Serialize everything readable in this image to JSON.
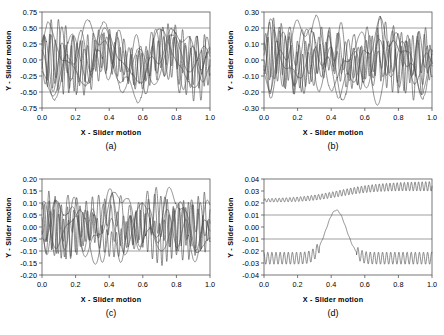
{
  "figure": {
    "type": "multi-panel-line-plot",
    "panels": 4,
    "shared_xlabel": "X - Slider motion",
    "shared_ylabel": "Y - Slider motion"
  },
  "chart_data": [
    {
      "type": "line",
      "panel": "a",
      "caption": "(a)",
      "title": "",
      "xlabel": "X - Slider motion",
      "ylabel": "Y - Slider motion",
      "xlim": [
        0.0,
        1.0
      ],
      "ylim": [
        -0.75,
        0.75
      ],
      "xticks": [
        0.0,
        0.2,
        0.4,
        0.6,
        0.8,
        1.0
      ],
      "xticklabels": [
        "0.0",
        "0.2",
        "0.4",
        "0.6",
        "0.8",
        "1.0"
      ],
      "yticks": [
        -0.75,
        -0.5,
        -0.25,
        0.0,
        0.25,
        0.5,
        0.75
      ],
      "yticklabels": [
        "-0.75",
        "-0.50",
        "-0.25",
        "0.00",
        "0.25",
        "0.50",
        "0.75"
      ],
      "grid": false,
      "legend": "none",
      "reference_lines": [
        0.5,
        -0.5
      ],
      "n_series": 7,
      "series": [
        {
          "name": "trace-1",
          "amp": 0.52,
          "freq": 23.0,
          "phase": 0.0,
          "drift": 0.0,
          "env": 1.0,
          "mod": 2.0
        },
        {
          "name": "trace-2",
          "amp": 0.5,
          "freq": 9.0,
          "phase": 1.1,
          "drift": 0.05,
          "env": 0.9,
          "mod": 3.0
        },
        {
          "name": "trace-3",
          "amp": 0.48,
          "freq": 5.0,
          "phase": 2.3,
          "drift": -0.04,
          "env": 1.0,
          "mod": 1.0
        },
        {
          "name": "trace-4",
          "amp": 0.51,
          "freq": 3.0,
          "phase": 0.6,
          "drift": 0.0,
          "env": 1.0,
          "mod": 5.0
        },
        {
          "name": "trace-5",
          "amp": 0.46,
          "freq": 15.0,
          "phase": 3.0,
          "drift": 0.02,
          "env": 0.85,
          "mod": 2.5
        },
        {
          "name": "trace-6",
          "amp": 0.53,
          "freq": 2.0,
          "phase": 4.2,
          "drift": -0.02,
          "env": 1.0,
          "mod": 7.0
        },
        {
          "name": "trace-7",
          "amp": 0.49,
          "freq": 31.0,
          "phase": 5.1,
          "drift": 0.0,
          "env": 0.8,
          "mod": 1.5
        }
      ]
    },
    {
      "type": "line",
      "panel": "b",
      "caption": "(b)",
      "title": "",
      "xlabel": "X - Slider motion",
      "ylabel": "Y - Slider motion",
      "xlim": [
        0.0,
        1.0
      ],
      "ylim": [
        -0.3,
        0.3
      ],
      "xticks": [
        0.0,
        0.2,
        0.4,
        0.6,
        0.8,
        1.0
      ],
      "xticklabels": [
        "0.0",
        "0.2",
        "0.4",
        "0.6",
        "0.8",
        "1.0"
      ],
      "yticks": [
        -0.3,
        -0.2,
        -0.1,
        0.0,
        0.1,
        0.2,
        0.3
      ],
      "yticklabels": [
        "-0.30",
        "-0.20",
        "-0.10",
        "0.00",
        "0.10",
        "0.20",
        "0.30"
      ],
      "grid": false,
      "legend": "none",
      "reference_lines": [
        0.2,
        -0.2
      ],
      "n_series": 7,
      "series": [
        {
          "name": "trace-1",
          "amp": 0.21,
          "freq": 21.0,
          "phase": 0.4,
          "drift": 0.03,
          "env": 0.95,
          "mod": 2.0
        },
        {
          "name": "trace-2",
          "amp": 0.2,
          "freq": 13.0,
          "phase": 1.8,
          "drift": 0.05,
          "env": 0.9,
          "mod": 3.0
        },
        {
          "name": "trace-3",
          "amp": 0.19,
          "freq": 7.0,
          "phase": 2.9,
          "drift": -0.05,
          "env": 1.0,
          "mod": 1.0
        },
        {
          "name": "trace-4",
          "amp": 0.22,
          "freq": 4.0,
          "phase": 0.2,
          "drift": 0.0,
          "env": 1.0,
          "mod": 6.0
        },
        {
          "name": "trace-5",
          "amp": 0.18,
          "freq": 29.0,
          "phase": 3.6,
          "drift": -0.03,
          "env": 0.8,
          "mod": 2.5
        },
        {
          "name": "trace-6",
          "amp": 0.21,
          "freq": 2.0,
          "phase": 5.0,
          "drift": 0.02,
          "env": 1.0,
          "mod": 9.0
        },
        {
          "name": "trace-7",
          "amp": 0.2,
          "freq": 17.0,
          "phase": 4.4,
          "drift": 0.0,
          "env": 0.88,
          "mod": 1.5
        }
      ]
    },
    {
      "type": "line",
      "panel": "c",
      "caption": "(c)",
      "title": "",
      "xlabel": "X - Slider motion",
      "ylabel": "Y - Slider motion",
      "xlim": [
        0.0,
        1.0
      ],
      "ylim": [
        -0.2,
        0.2
      ],
      "xticks": [
        0.0,
        0.2,
        0.4,
        0.6,
        0.8,
        1.0
      ],
      "xticklabels": [
        "0.0",
        "0.2",
        "0.4",
        "0.6",
        "0.8",
        "1.0"
      ],
      "yticks": [
        -0.2,
        -0.15,
        -0.1,
        -0.05,
        0.0,
        0.05,
        0.1,
        0.15,
        0.2
      ],
      "yticklabels": [
        "-0.20",
        "-0.15",
        "-0.10",
        "-0.05",
        "0.00",
        "0.05",
        "0.10",
        "0.15",
        "0.20"
      ],
      "grid": false,
      "legend": "none",
      "reference_lines": [
        0.1,
        -0.1
      ],
      "n_series": 6,
      "series": [
        {
          "name": "trace-1",
          "amp": 0.13,
          "freq": 27.0,
          "phase": 0.9,
          "drift": 0.02,
          "env": 0.9,
          "mod": 2.0
        },
        {
          "name": "trace-2",
          "amp": 0.12,
          "freq": 19.0,
          "phase": 2.1,
          "drift": 0.04,
          "env": 0.85,
          "mod": 3.0
        },
        {
          "name": "trace-3",
          "amp": 0.11,
          "freq": 9.0,
          "phase": 3.3,
          "drift": -0.03,
          "env": 1.0,
          "mod": 1.0
        },
        {
          "name": "trace-4",
          "amp": 0.14,
          "freq": 5.0,
          "phase": 1.4,
          "drift": 0.0,
          "env": 1.0,
          "mod": 6.0
        },
        {
          "name": "trace-5",
          "amp": 0.12,
          "freq": 35.0,
          "phase": 4.7,
          "drift": -0.04,
          "env": 0.78,
          "mod": 2.5
        },
        {
          "name": "trace-6",
          "amp": 0.13,
          "freq": 3.0,
          "phase": 5.6,
          "drift": 0.03,
          "env": 1.0,
          "mod": 8.0
        }
      ]
    },
    {
      "type": "line",
      "panel": "d",
      "caption": "(d)",
      "title": "",
      "xlabel": "X - Slider motion",
      "ylabel": "Y - Slider motion",
      "xlim": [
        0.0,
        1.0
      ],
      "ylim": [
        -0.04,
        0.04
      ],
      "xticks": [
        0.0,
        0.2,
        0.4,
        0.6,
        0.8,
        1.0
      ],
      "xticklabels": [
        "0.0",
        "0.2",
        "0.4",
        "0.6",
        "0.8",
        "1.0"
      ],
      "yticks": [
        -0.04,
        -0.03,
        -0.02,
        -0.01,
        0.0,
        0.01,
        0.02,
        0.03,
        0.04
      ],
      "yticklabels": [
        "-0.04",
        "-0.03",
        "-0.02",
        "-0.01",
        "0.00",
        "0.01",
        "0.02",
        "0.03",
        "0.04"
      ],
      "grid": false,
      "legend": "none",
      "reference_lines": [
        0.01,
        -0.01
      ],
      "n_series": 2,
      "series": [
        {
          "name": "upper-trace",
          "amp": 0.004,
          "freq": 47.0,
          "phase": 0.0,
          "drift": 0.022,
          "env": 1.0,
          "mod": 0.0,
          "shape": "rise",
          "shape_amp": 0.012
        },
        {
          "name": "lower-trace",
          "amp": 0.005,
          "freq": 41.0,
          "phase": 2.0,
          "drift": -0.026,
          "env": 1.0,
          "mod": 0.0,
          "shape": "bump",
          "shape_amp": 0.04
        }
      ]
    }
  ]
}
